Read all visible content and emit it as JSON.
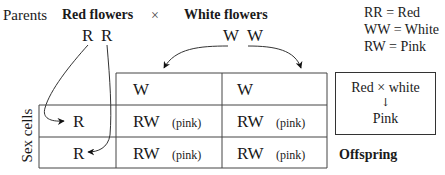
{
  "parents": {
    "label": "Parents",
    "red": "Red flowers",
    "cross": "×",
    "white": "White flowers",
    "red_alleles": [
      "R",
      "R"
    ],
    "white_alleles": [
      "W",
      "W"
    ]
  },
  "key": [
    "RR = Red",
    "WW = White",
    "RW = Pink"
  ],
  "grid": {
    "header": [
      "W",
      "W"
    ],
    "rows": [
      {
        "allele": "R",
        "cells": [
          {
            "genotype": "RW",
            "note": "(pink)"
          },
          {
            "genotype": "RW",
            "note": "(pink)"
          }
        ]
      },
      {
        "allele": "R",
        "cells": [
          {
            "genotype": "RW",
            "note": "(pink)"
          },
          {
            "genotype": "RW",
            "note": "(pink)"
          }
        ]
      }
    ],
    "side_label": "Sex cells",
    "offspring_label": "Offspring"
  },
  "summary": {
    "top": "Red × white",
    "arrow": "↓",
    "bottom": "Pink"
  }
}
